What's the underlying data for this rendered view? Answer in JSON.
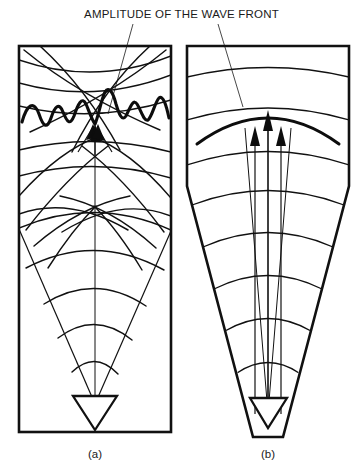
{
  "figure": {
    "title": "AMPLITUDE OF THE WAVE FRONT",
    "width": 363,
    "height": 474,
    "background_color": "#ffffff",
    "ink_color": "#111111"
  },
  "panels": [
    {
      "id": "a",
      "label": "(a)",
      "caption_position": "below-panel",
      "frame_shape": "rectangle",
      "wavefront_type": "irregular",
      "amplitude_trace": "oscillating-wiggly-line",
      "description_role": "non-uniform wave front with interfering arcs",
      "arrow_count": 3,
      "arc_count": 9
    },
    {
      "id": "b",
      "label": "(b)",
      "caption_position": "below-panel",
      "frame_shape": "rectangle-over-cone",
      "wavefront_type": "uniform",
      "amplitude_trace": "smooth-arc",
      "description_role": "uniform wave front with smooth arc",
      "arrow_count": 3,
      "arc_count": 8
    }
  ],
  "annotations": {
    "leader_lines": 2,
    "leader_target_a": "amplitude-trace-panel-a",
    "leader_target_b": "wavefront-arc-panel-b"
  },
  "icons": {
    "transducer": "transducer-triangle-icon",
    "arrow": "up-arrow-icon"
  }
}
